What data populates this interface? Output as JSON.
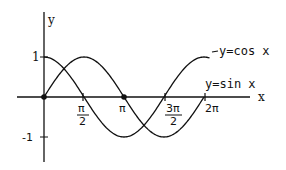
{
  "chart_data": {
    "type": "line",
    "title": "",
    "xlabel": "x",
    "ylabel": "y",
    "xlim": [
      0,
      6.8
    ],
    "ylim": [
      -1.6,
      2.0
    ],
    "grid": false,
    "x_ticks": [
      {
        "value": 1.5708,
        "label_num": "π",
        "label_den": "2",
        "label": "π/2"
      },
      {
        "value": 3.1416,
        "label": "π"
      },
      {
        "value": 4.7124,
        "label_num": "3π",
        "label_den": "2",
        "label": "3π/2"
      },
      {
        "value": 6.2832,
        "label": "2π"
      }
    ],
    "y_ticks": [
      {
        "value": 1,
        "label": "1"
      },
      {
        "value": -1,
        "label": "-1"
      }
    ],
    "series": [
      {
        "name": "y=cos x",
        "function": "cos",
        "x_range": [
          0,
          6.5
        ],
        "key_points": [
          [
            0,
            1
          ],
          [
            1.5708,
            0
          ],
          [
            3.1416,
            -1
          ],
          [
            4.7124,
            0
          ],
          [
            6.2832,
            1
          ]
        ]
      },
      {
        "name": "y=sin x",
        "function": "sin",
        "x_range": [
          0,
          6.2832
        ],
        "key_points": [
          [
            0,
            0
          ],
          [
            1.5708,
            1
          ],
          [
            3.1416,
            0
          ],
          [
            4.7124,
            -1
          ],
          [
            6.2832,
            0
          ]
        ]
      }
    ],
    "marked_points": [
      [
        0,
        0
      ],
      [
        3.1416,
        0
      ]
    ],
    "annotations": [
      {
        "text": "y=cos x",
        "near": "end of cosine curve"
      },
      {
        "text": "y=sin x",
        "near": "x = 2π, above axis"
      }
    ]
  },
  "labels": {
    "x_axis": "x",
    "y_axis": "y",
    "y_one": "1",
    "y_neg_one": "-1",
    "pi_half_num": "π",
    "pi_half_den": "2",
    "pi": "π",
    "three_pi_half_num": "3π",
    "three_pi_half_den": "2",
    "two_pi": "2π",
    "cos_label": "y=cos x",
    "sin_label": "y=sin x"
  },
  "colors": {
    "stroke": "#111111",
    "background": "#ffffff"
  }
}
